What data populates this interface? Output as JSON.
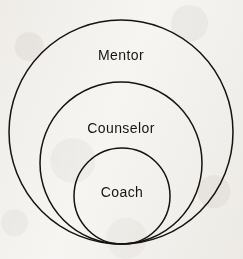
{
  "diagram": {
    "type": "nested-tangent-circles",
    "title": "",
    "background_color": "#f8f7f5",
    "stroke_color": "#15120f",
    "text_color": "#17140f",
    "rings": [
      {
        "id": "mentor",
        "label": "Mentor",
        "level": 1,
        "scope": "outermost",
        "center_x": 121,
        "center_y": 132,
        "radius": 112,
        "label_x": 121,
        "label_y": 55
      },
      {
        "id": "counselor",
        "label": "Counselor",
        "level": 2,
        "scope": "middle",
        "center_x": 121,
        "center_y": 163,
        "radius": 81,
        "label_x": 121,
        "label_y": 128
      },
      {
        "id": "coach",
        "label": "Coach",
        "level": 3,
        "scope": "innermost",
        "center_x": 122,
        "center_y": 196,
        "radius": 48,
        "label_x": 122,
        "label_y": 192
      }
    ]
  }
}
